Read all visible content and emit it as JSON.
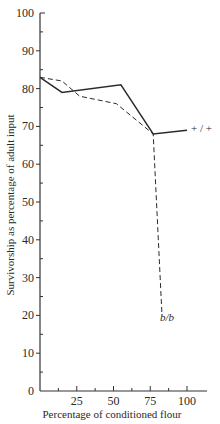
{
  "chart_data": {
    "type": "line",
    "title": "",
    "xlabel": "Percentage of conditioned flour",
    "ylabel": "Survivorship as percentage of adult input",
    "xlim": [
      0,
      100
    ],
    "ylim": [
      0,
      100
    ],
    "x_ticks": [
      25,
      50,
      75,
      100
    ],
    "x_minor_ticks": [
      12.5,
      37.5,
      62.5,
      87.5
    ],
    "y_ticks": [
      0,
      10,
      20,
      30,
      40,
      50,
      60,
      70,
      80,
      90,
      100
    ],
    "y_minor_step": 5,
    "grid": false,
    "legend": "inline labels at line ends",
    "series": [
      {
        "name": "+/+",
        "style": "solid",
        "x": [
          0,
          15,
          55,
          77,
          100
        ],
        "values": [
          83,
          79,
          81,
          68,
          69
        ]
      },
      {
        "name": "b/b",
        "style": "dashed",
        "x": [
          0,
          15,
          27,
          52,
          77,
          83
        ],
        "values": [
          83,
          82,
          78,
          76,
          68,
          20
        ]
      }
    ]
  },
  "labels": {
    "series_plus": "+ / +",
    "series_bb": "b/b"
  }
}
